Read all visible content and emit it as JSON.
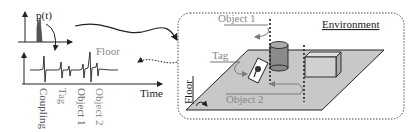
{
  "signal_panel": {
    "top_plot_label": "p(t)",
    "bottom_plot_floor_label": "Floor",
    "time_axis_label": "Time",
    "event_labels": [
      "Coupling",
      "Tag",
      "Object 1",
      "Object 2"
    ]
  },
  "environment_panel": {
    "title": "Environment",
    "labels": {
      "object1": "Object 1",
      "tag": "Tag",
      "floor": "Floor",
      "object2": "Object 2"
    }
  },
  "colors": {
    "ink": "#222222",
    "gray_text": "#888888",
    "floor_fill": "#c8c8c8",
    "cylinder_fill": "#8a8a8a",
    "box_fill": "#d0d0d0",
    "arrow_gray": "#7a7a7a"
  }
}
